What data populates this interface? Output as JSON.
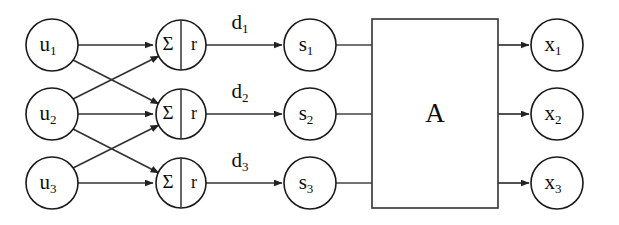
{
  "diagram": {
    "canvas": {
      "width": 619,
      "height": 225,
      "background": "#ffffff"
    },
    "stroke_color": "#333333",
    "text_color": "#0d0d0d",
    "columns": [
      {
        "id": "inputs",
        "center_x": 52,
        "radius": 26
      },
      {
        "id": "summers",
        "center_x": 181,
        "radius": 25
      },
      {
        "id": "states",
        "center_x": 310,
        "radius": 26
      },
      {
        "id": "block",
        "left": 372,
        "right": 498
      },
      {
        "id": "outputs",
        "center_x": 557,
        "radius": 26
      }
    ],
    "rows_y": [
      45,
      114,
      183
    ],
    "nodes": {
      "inputs": [
        {
          "name": "u-node-1",
          "base": "u",
          "sub": "1",
          "cx": 52,
          "cy": 45,
          "r": 26
        },
        {
          "name": "u-node-2",
          "base": "u",
          "sub": "2",
          "cx": 52,
          "cy": 114,
          "r": 26
        },
        {
          "name": "u-node-3",
          "base": "u",
          "sub": "3",
          "cx": 52,
          "cy": 183,
          "r": 26
        }
      ],
      "summers": [
        {
          "name": "summer-node-1",
          "left_symbol": "Σ",
          "right_symbol": "r",
          "cx": 181,
          "cy": 45,
          "r": 25
        },
        {
          "name": "summer-node-2",
          "left_symbol": "Σ",
          "right_symbol": "r",
          "cx": 181,
          "cy": 114,
          "r": 25
        },
        {
          "name": "summer-node-3",
          "left_symbol": "Σ",
          "right_symbol": "r",
          "cx": 181,
          "cy": 183,
          "r": 25
        }
      ],
      "states": [
        {
          "name": "s-node-1",
          "base": "s",
          "sub": "1",
          "cx": 310,
          "cy": 45,
          "r": 26
        },
        {
          "name": "s-node-2",
          "base": "s",
          "sub": "2",
          "cx": 310,
          "cy": 114,
          "r": 26
        },
        {
          "name": "s-node-3",
          "base": "s",
          "sub": "3",
          "cx": 310,
          "cy": 183,
          "r": 26
        }
      ],
      "outputs": [
        {
          "name": "x-node-1",
          "base": "x",
          "sub": "1",
          "cx": 557,
          "cy": 45,
          "r": 26
        },
        {
          "name": "x-node-2",
          "base": "x",
          "sub": "2",
          "cx": 557,
          "cy": 114,
          "r": 26
        },
        {
          "name": "x-node-3",
          "base": "x",
          "sub": "3",
          "cx": 557,
          "cy": 183,
          "r": 26
        }
      ]
    },
    "block": {
      "name": "matrix-block-a",
      "label": "A",
      "x": 372,
      "y": 19,
      "width": 126,
      "height": 189,
      "label_x": 435,
      "label_y": 116
    },
    "edge_labels": [
      {
        "name": "edge-label-d1",
        "base": "d",
        "sub": "1",
        "x": 240,
        "y": 24
      },
      {
        "name": "edge-label-d2",
        "base": "d",
        "sub": "2",
        "x": 240,
        "y": 93
      },
      {
        "name": "edge-label-d3",
        "base": "d",
        "sub": "3",
        "x": 240,
        "y": 162
      }
    ],
    "edges": {
      "input_to_summer": [
        {
          "name": "edge-u1-sum1",
          "from": "u1",
          "to": "sum1",
          "arrow": true
        },
        {
          "name": "edge-u1-sum2",
          "from": "u1",
          "to": "sum2",
          "arrow": true
        },
        {
          "name": "edge-u2-sum1",
          "from": "u2",
          "to": "sum1",
          "arrow": true
        },
        {
          "name": "edge-u2-sum2",
          "from": "u2",
          "to": "sum2",
          "arrow": true
        },
        {
          "name": "edge-u2-sum3",
          "from": "u2",
          "to": "sum3",
          "arrow": true
        },
        {
          "name": "edge-u3-sum2",
          "from": "u3",
          "to": "sum2",
          "arrow": true
        },
        {
          "name": "edge-u3-sum3",
          "from": "u3",
          "to": "sum3",
          "arrow": true
        }
      ],
      "summer_to_state": [
        {
          "name": "edge-sum1-s1",
          "label": "d1",
          "arrow": true
        },
        {
          "name": "edge-sum2-s2",
          "label": "d2",
          "arrow": true
        },
        {
          "name": "edge-sum3-s3",
          "label": "d3",
          "arrow": true
        }
      ],
      "state_to_block": [
        {
          "name": "edge-s1-block",
          "arrow": false
        },
        {
          "name": "edge-s2-block",
          "arrow": false
        },
        {
          "name": "edge-s3-block",
          "arrow": false
        }
      ],
      "block_to_output": [
        {
          "name": "edge-block-x1",
          "arrow": true
        },
        {
          "name": "edge-block-x2",
          "arrow": true
        },
        {
          "name": "edge-block-x3",
          "arrow": true
        }
      ]
    }
  }
}
